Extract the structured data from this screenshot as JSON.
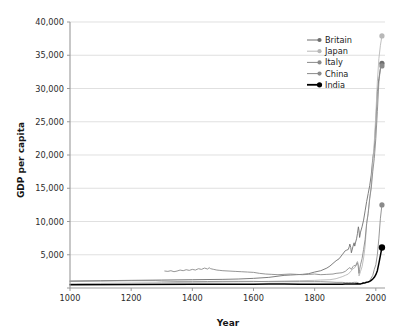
{
  "chart_data": {
    "type": "line",
    "title": "",
    "xlabel": "Year",
    "ylabel": "GDP per capita",
    "xlim": [
      1000,
      2030
    ],
    "ylim": [
      0,
      40000
    ],
    "grid": true,
    "legend_position": "top-right",
    "x_ticks": [
      1000,
      1200,
      1400,
      1600,
      1800,
      2000
    ],
    "x_tick_labels": [
      "1000",
      "1200",
      "1400",
      "1600",
      "1800",
      "2000"
    ],
    "y_ticks": [
      0,
      5000,
      10000,
      15000,
      20000,
      25000,
      30000,
      35000,
      40000
    ],
    "y_tick_labels": [
      "",
      "5,000",
      "10,000",
      "15,000",
      "20,000",
      "25,000",
      "30,000",
      "35,000",
      "40,000"
    ],
    "series": [
      {
        "name": "Britain",
        "color": "#6f6f6f",
        "width": 0.9,
        "end_marker": true,
        "end_value": 33800,
        "points": [
          [
            1000,
            1050
          ],
          [
            1100,
            1100
          ],
          [
            1200,
            1150
          ],
          [
            1300,
            1200
          ],
          [
            1400,
            1250
          ],
          [
            1500,
            1300
          ],
          [
            1550,
            1350
          ],
          [
            1600,
            1450
          ],
          [
            1650,
            1600
          ],
          [
            1700,
            1900
          ],
          [
            1720,
            1950
          ],
          [
            1740,
            2000
          ],
          [
            1760,
            2050
          ],
          [
            1780,
            2150
          ],
          [
            1800,
            2400
          ],
          [
            1820,
            2600
          ],
          [
            1840,
            3000
          ],
          [
            1850,
            3300
          ],
          [
            1860,
            3700
          ],
          [
            1870,
            4100
          ],
          [
            1880,
            4400
          ],
          [
            1890,
            5000
          ],
          [
            1900,
            5600
          ],
          [
            1905,
            5700
          ],
          [
            1910,
            5800
          ],
          [
            1913,
            6200
          ],
          [
            1915,
            6600
          ],
          [
            1918,
            6100
          ],
          [
            1920,
            5300
          ],
          [
            1925,
            6200
          ],
          [
            1929,
            6800
          ],
          [
            1931,
            6300
          ],
          [
            1934,
            6900
          ],
          [
            1937,
            7400
          ],
          [
            1940,
            8200
          ],
          [
            1943,
            9200
          ],
          [
            1945,
            8600
          ],
          [
            1947,
            7600
          ],
          [
            1950,
            8400
          ],
          [
            1955,
            9200
          ],
          [
            1960,
            10200
          ],
          [
            1965,
            11600
          ],
          [
            1970,
            13000
          ],
          [
            1975,
            14200
          ],
          [
            1980,
            15400
          ],
          [
            1985,
            17000
          ],
          [
            1990,
            19500
          ],
          [
            1995,
            21000
          ],
          [
            2000,
            25000
          ],
          [
            2005,
            29500
          ],
          [
            2010,
            31500
          ],
          [
            2015,
            33000
          ],
          [
            2020,
            33800
          ]
        ]
      },
      {
        "name": "Japan",
        "color": "#b8b8b8",
        "width": 0.9,
        "end_marker": true,
        "end_value": 37900,
        "points": [
          [
            1000,
            650
          ],
          [
            1100,
            700
          ],
          [
            1200,
            750
          ],
          [
            1300,
            800
          ],
          [
            1400,
            850
          ],
          [
            1500,
            900
          ],
          [
            1600,
            950
          ],
          [
            1650,
            1000
          ],
          [
            1700,
            1050
          ],
          [
            1750,
            1100
          ],
          [
            1800,
            1150
          ],
          [
            1820,
            1200
          ],
          [
            1850,
            1250
          ],
          [
            1870,
            1400
          ],
          [
            1880,
            1550
          ],
          [
            1890,
            1700
          ],
          [
            1900,
            1900
          ],
          [
            1910,
            2100
          ],
          [
            1920,
            2600
          ],
          [
            1925,
            2900
          ],
          [
            1930,
            3000
          ],
          [
            1935,
            3400
          ],
          [
            1938,
            3900
          ],
          [
            1940,
            4000
          ],
          [
            1942,
            3600
          ],
          [
            1944,
            3200
          ],
          [
            1945,
            1800
          ],
          [
            1946,
            1900
          ],
          [
            1948,
            2200
          ],
          [
            1950,
            2500
          ],
          [
            1955,
            3200
          ],
          [
            1960,
            4500
          ],
          [
            1965,
            6300
          ],
          [
            1970,
            9700
          ],
          [
            1975,
            11300
          ],
          [
            1980,
            13400
          ],
          [
            1985,
            15500
          ],
          [
            1990,
            19000
          ],
          [
            1995,
            22000
          ],
          [
            2000,
            26000
          ],
          [
            2005,
            31000
          ],
          [
            2010,
            34500
          ],
          [
            2015,
            36500
          ],
          [
            2020,
            37900
          ]
        ]
      },
      {
        "name": "Italy",
        "color": "#8a8a8a",
        "width": 0.9,
        "end_marker": true,
        "end_value": 33400,
        "points": [
          [
            1310,
            2550
          ],
          [
            1320,
            2500
          ],
          [
            1330,
            2600
          ],
          [
            1340,
            2450
          ],
          [
            1350,
            2550
          ],
          [
            1360,
            2700
          ],
          [
            1370,
            2600
          ],
          [
            1380,
            2750
          ],
          [
            1390,
            2650
          ],
          [
            1400,
            2800
          ],
          [
            1410,
            2700
          ],
          [
            1420,
            2900
          ],
          [
            1430,
            2800
          ],
          [
            1440,
            3000
          ],
          [
            1450,
            2850
          ],
          [
            1455,
            3050
          ],
          [
            1460,
            2900
          ],
          [
            1470,
            2800
          ],
          [
            1480,
            2700
          ],
          [
            1490,
            2650
          ],
          [
            1500,
            2600
          ],
          [
            1520,
            2550
          ],
          [
            1540,
            2500
          ],
          [
            1560,
            2450
          ],
          [
            1580,
            2400
          ],
          [
            1600,
            2350
          ],
          [
            1620,
            2200
          ],
          [
            1640,
            2100
          ],
          [
            1660,
            2050
          ],
          [
            1680,
            2000
          ],
          [
            1700,
            2050
          ],
          [
            1720,
            2100
          ],
          [
            1740,
            2050
          ],
          [
            1760,
            2000
          ],
          [
            1780,
            2050
          ],
          [
            1800,
            2100
          ],
          [
            1820,
            2000
          ],
          [
            1840,
            2050
          ],
          [
            1860,
            2100
          ],
          [
            1870,
            2200
          ],
          [
            1880,
            2250
          ],
          [
            1890,
            2300
          ],
          [
            1900,
            2500
          ],
          [
            1910,
            2900
          ],
          [
            1913,
            3050
          ],
          [
            1918,
            2950
          ],
          [
            1920,
            2800
          ],
          [
            1925,
            3200
          ],
          [
            1929,
            3400
          ],
          [
            1934,
            3300
          ],
          [
            1938,
            3700
          ],
          [
            1940,
            3800
          ],
          [
            1942,
            3400
          ],
          [
            1945,
            2200
          ],
          [
            1947,
            2800
          ],
          [
            1950,
            3500
          ],
          [
            1955,
            4400
          ],
          [
            1960,
            5800
          ],
          [
            1965,
            7300
          ],
          [
            1970,
            9700
          ],
          [
            1975,
            11200
          ],
          [
            1980,
            13500
          ],
          [
            1985,
            15000
          ],
          [
            1990,
            17500
          ],
          [
            1995,
            19500
          ],
          [
            2000,
            22500
          ],
          [
            2005,
            26500
          ],
          [
            2010,
            31000
          ],
          [
            2015,
            33000
          ],
          [
            2020,
            33400
          ]
        ]
      },
      {
        "name": "China",
        "color": "#8a8a8a",
        "width": 0.9,
        "end_marker": true,
        "end_value": 12500,
        "points": [
          [
            1000,
            1000
          ],
          [
            1100,
            1050
          ],
          [
            1200,
            1100
          ],
          [
            1280,
            1100
          ],
          [
            1300,
            1050
          ],
          [
            1350,
            1000
          ],
          [
            1400,
            1000
          ],
          [
            1450,
            980
          ],
          [
            1500,
            1000
          ],
          [
            1550,
            1000
          ],
          [
            1600,
            1000
          ],
          [
            1650,
            950
          ],
          [
            1700,
            950
          ],
          [
            1750,
            950
          ],
          [
            1800,
            950
          ],
          [
            1820,
            950
          ],
          [
            1850,
            900
          ],
          [
            1870,
            850
          ],
          [
            1890,
            850
          ],
          [
            1900,
            800
          ],
          [
            1910,
            800
          ],
          [
            1920,
            800
          ],
          [
            1930,
            850
          ],
          [
            1938,
            850
          ],
          [
            1945,
            700
          ],
          [
            1950,
            600
          ],
          [
            1955,
            750
          ],
          [
            1960,
            800
          ],
          [
            1962,
            650
          ],
          [
            1965,
            750
          ],
          [
            1970,
            850
          ],
          [
            1975,
            950
          ],
          [
            1980,
            1100
          ],
          [
            1985,
            1500
          ],
          [
            1990,
            1900
          ],
          [
            1995,
            2800
          ],
          [
            2000,
            3500
          ],
          [
            2005,
            5000
          ],
          [
            2010,
            7500
          ],
          [
            2015,
            10500
          ],
          [
            2020,
            12500
          ]
        ]
      },
      {
        "name": "India",
        "color": "#000000",
        "width": 1.5,
        "end_marker": true,
        "end_value": 6100,
        "points": [
          [
            1000,
            500
          ],
          [
            1200,
            520
          ],
          [
            1400,
            550
          ],
          [
            1500,
            560
          ],
          [
            1600,
            580
          ],
          [
            1650,
            590
          ],
          [
            1700,
            600
          ],
          [
            1750,
            580
          ],
          [
            1800,
            570
          ],
          [
            1820,
            560
          ],
          [
            1850,
            550
          ],
          [
            1870,
            560
          ],
          [
            1890,
            580
          ],
          [
            1900,
            600
          ],
          [
            1910,
            610
          ],
          [
            1920,
            600
          ],
          [
            1930,
            620
          ],
          [
            1940,
            640
          ],
          [
            1945,
            620
          ],
          [
            1950,
            620
          ],
          [
            1955,
            680
          ],
          [
            1960,
            750
          ],
          [
            1965,
            800
          ],
          [
            1970,
            870
          ],
          [
            1975,
            900
          ],
          [
            1980,
            1000
          ],
          [
            1985,
            1150
          ],
          [
            1990,
            1350
          ],
          [
            1995,
            1600
          ],
          [
            2000,
            2000
          ],
          [
            2005,
            2600
          ],
          [
            2010,
            3700
          ],
          [
            2015,
            4900
          ],
          [
            2020,
            6100
          ]
        ]
      }
    ]
  },
  "legend": {
    "entries": [
      {
        "label": "Britain",
        "color": "#6f6f6f"
      },
      {
        "label": "Japan",
        "color": "#b8b8b8"
      },
      {
        "label": "Italy",
        "color": "#8a8a8a"
      },
      {
        "label": "China",
        "color": "#8a8a8a"
      },
      {
        "label": "India",
        "color": "#000000"
      }
    ]
  },
  "axes": {
    "x_title": "Year",
    "y_title": "GDP per capita"
  },
  "colors": {
    "gridline": "#d2d2d2",
    "spine": "#9a9a9a",
    "background": "#ffffff",
    "text": "#2b2b2b"
  }
}
